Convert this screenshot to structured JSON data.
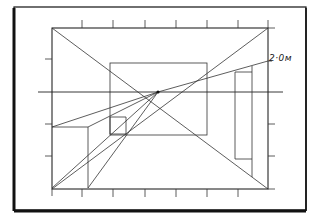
{
  "diagram": {
    "type": "perspective-drawing",
    "annotations": [
      {
        "id": "height-label",
        "text": "2·0м"
      }
    ],
    "elements": [
      "picture-frame",
      "picture-plane-rectangle",
      "back-wall-rectangle",
      "horizon-line",
      "vanishing-point",
      "corner-diagonals",
      "left-box",
      "right-doorway",
      "measuring-ticks"
    ],
    "colors": {
      "ink": "#222222",
      "paper": "#ffffff"
    }
  }
}
